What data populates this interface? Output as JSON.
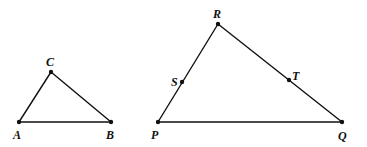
{
  "diagram": {
    "type": "geometry",
    "colors": {
      "stroke": "#111111",
      "background": "#ffffff"
    },
    "triangles": [
      {
        "name": "ABC",
        "points": [
          {
            "label": "A",
            "x": 19,
            "y": 122,
            "lx": 13,
            "ly": 139
          },
          {
            "label": "B",
            "x": 111,
            "y": 122,
            "lx": 106,
            "ly": 139
          },
          {
            "label": "C",
            "x": 51,
            "y": 72,
            "lx": 46,
            "ly": 66
          }
        ],
        "segments": [
          [
            "A",
            "B"
          ],
          [
            "B",
            "C"
          ],
          [
            "C",
            "A"
          ]
        ]
      },
      {
        "name": "PQR",
        "points": [
          {
            "label": "P",
            "x": 158,
            "y": 122,
            "lx": 151,
            "ly": 139
          },
          {
            "label": "Q",
            "x": 342,
            "y": 122,
            "lx": 338,
            "ly": 140
          },
          {
            "label": "R",
            "x": 218,
            "y": 24,
            "lx": 213,
            "ly": 18
          },
          {
            "label": "S",
            "x": 182,
            "y": 82,
            "lx": 171,
            "ly": 86
          },
          {
            "label": "T",
            "x": 289,
            "y": 80,
            "lx": 292,
            "ly": 80
          }
        ],
        "segments": [
          [
            "P",
            "Q"
          ],
          [
            "Q",
            "R"
          ],
          [
            "R",
            "P"
          ]
        ]
      }
    ],
    "labels": {
      "A": "A",
      "B": "B",
      "C": "C",
      "P": "P",
      "Q": "Q",
      "R": "R",
      "S": "S",
      "T": "T"
    }
  }
}
